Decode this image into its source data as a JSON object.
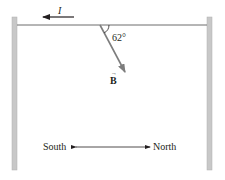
{
  "diagram": {
    "current_label": "I",
    "angle_label": "62°",
    "field_label": "B",
    "field_vector_arrow": "→",
    "direction_left": "South",
    "direction_right": "North",
    "angle_degrees": 62
  },
  "colors": {
    "post": "#c8c8c8",
    "post_edge": "#a9a9a9",
    "wire": "#6d6d6d",
    "vector": "#7d7d7d",
    "text": "#231f20"
  }
}
